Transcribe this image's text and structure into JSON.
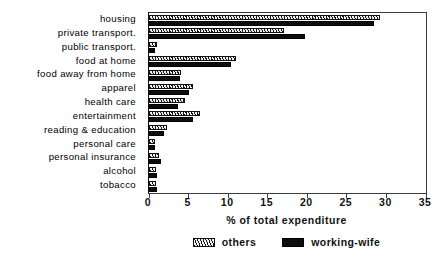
{
  "chart_data": {
    "type": "bar",
    "orientation": "horizontal",
    "title": "",
    "xlabel": "% of total expenditure",
    "ylabel": "",
    "xlim": [
      0,
      35
    ],
    "xticks": [
      0,
      5,
      10,
      15,
      20,
      25,
      30,
      35
    ],
    "xticklabels": [
      "0",
      "5",
      "10",
      "15",
      "20",
      "25",
      "30",
      "35"
    ],
    "grid": false,
    "legend_position": "bottom-center",
    "categories": [
      "housing",
      "private transport.",
      "public transport.",
      "food at home",
      "food away from home",
      "apparel",
      "health care",
      "entertainment",
      "reading & education",
      "personal care",
      "personal insurance",
      "alcohol",
      "tobacco"
    ],
    "series": [
      {
        "name": "others",
        "pattern": "hatched",
        "color": "#111111",
        "values": [
          29.2,
          17.0,
          1.0,
          11.0,
          4.1,
          5.6,
          4.5,
          6.4,
          2.3,
          0.7,
          1.3,
          0.9,
          0.9
        ]
      },
      {
        "name": "working-wife",
        "pattern": "solid",
        "color": "#0d0d0d",
        "values": [
          28.4,
          19.7,
          0.8,
          10.4,
          3.9,
          5.1,
          3.7,
          5.5,
          1.9,
          0.8,
          1.5,
          1.0,
          1.0
        ]
      }
    ]
  },
  "legend": {
    "entries": [
      {
        "label": "others",
        "swatch": "hatched-swatch-icon"
      },
      {
        "label": "working-wife",
        "swatch": "solid-swatch-icon"
      }
    ]
  }
}
